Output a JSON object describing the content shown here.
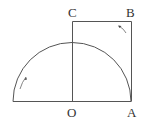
{
  "diagram": {
    "points": [
      {
        "id": "C",
        "label": "C"
      },
      {
        "id": "B",
        "label": "B"
      },
      {
        "id": "O",
        "label": "O"
      },
      {
        "id": "A",
        "label": "A"
      }
    ],
    "shapes": [
      "semicircle centered at O with radius OA",
      "rectangle OABC"
    ],
    "arrows": [
      "counterclockwise rotation arrow inside semicircle (left)",
      "rotation arrow near corner B"
    ],
    "colors": {
      "stroke": "#555555",
      "label": "#333333",
      "background": "#ffffff"
    }
  }
}
